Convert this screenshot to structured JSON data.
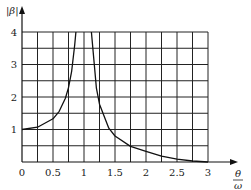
{
  "chart_data": {
    "type": "line",
    "title": "",
    "xlabel": "θ/ω",
    "ylabel": "|β|",
    "xlim": [
      0,
      3
    ],
    "ylim": [
      0,
      4
    ],
    "grid": true,
    "x_ticks": [
      "0",
      "0.5",
      "1",
      "1.5",
      "2",
      "2.5",
      "3"
    ],
    "y_ticks": [
      "1",
      "2",
      "3",
      "4"
    ],
    "series": [
      {
        "name": "|β| (below resonance)",
        "x": [
          0,
          0.25,
          0.5,
          0.6,
          0.7,
          0.75,
          0.8,
          0.85,
          0.87
        ],
        "y": [
          1.0,
          1.07,
          1.33,
          1.56,
          1.96,
          2.29,
          2.78,
          3.6,
          4.0
        ]
      },
      {
        "name": "|β| (above resonance)",
        "x": [
          1.12,
          1.2,
          1.25,
          1.4,
          1.5,
          1.75,
          2.0,
          2.25,
          2.5,
          2.75,
          3.0
        ],
        "y": [
          4.0,
          2.27,
          1.78,
          1.04,
          0.8,
          0.48,
          0.33,
          0.18,
          0.09,
          0.03,
          0.0
        ]
      }
    ]
  },
  "labels": {
    "y_axis": "|β|",
    "x_axis_num": "θ",
    "x_axis_den": "ω"
  }
}
